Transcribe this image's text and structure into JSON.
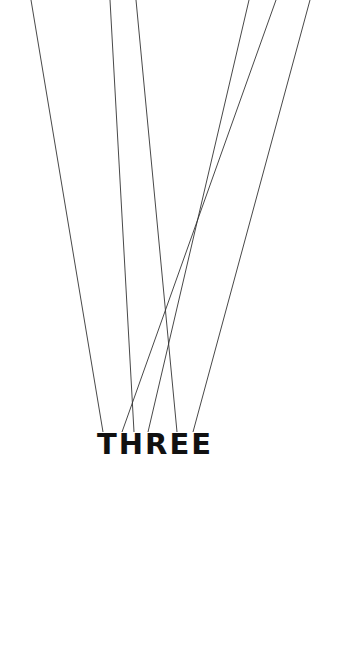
{
  "title": "THREE",
  "colors": {
    "background": "#ffffff",
    "text": "#111111",
    "lines": "#333333"
  },
  "lines": [
    {
      "x1": 31,
      "y1": 0,
      "x2": 103,
      "y2": 432
    },
    {
      "x1": 110,
      "y1": 0,
      "x2": 134,
      "y2": 432
    },
    {
      "x1": 136,
      "y1": 0,
      "x2": 177,
      "y2": 432
    },
    {
      "x1": 249,
      "y1": 0,
      "x2": 148,
      "y2": 432
    },
    {
      "x1": 276,
      "y1": 0,
      "x2": 122,
      "y2": 432
    },
    {
      "x1": 310,
      "y1": 0,
      "x2": 193,
      "y2": 432
    }
  ]
}
